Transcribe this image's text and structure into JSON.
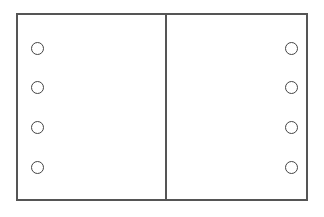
{
  "diagram": {
    "type": "two-panel sheet with punch holes",
    "panels": [
      {
        "name": "left-panel",
        "holes": 4,
        "side": "left"
      },
      {
        "name": "right-panel",
        "holes": 4,
        "side": "right"
      }
    ],
    "colors": {
      "line": "#555555",
      "hole": "#444444",
      "background": "#ffffff"
    },
    "hole_positions": {
      "left_x": 31,
      "right_x": 285,
      "y": [
        42,
        81,
        121,
        161
      ]
    }
  }
}
